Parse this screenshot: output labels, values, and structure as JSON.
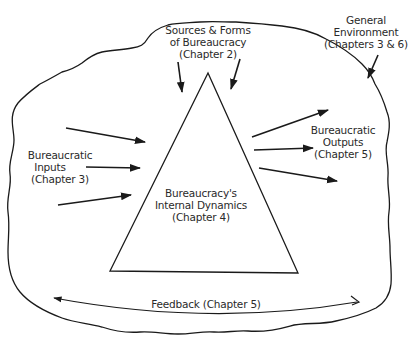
{
  "diagram": {
    "type": "conceptual-model",
    "colors": {
      "ink": "#1a1a1a",
      "text": "#2a2a2a",
      "background": "#ffffff"
    },
    "labels": {
      "sources": {
        "lines": [
          "Sources & Forms",
          "of Bureaucracy",
          "(Chapter 2)"
        ]
      },
      "environment": {
        "lines": [
          "General",
          "Environment",
          "(Chapters 3 & 6)"
        ]
      },
      "inputs": {
        "lines": [
          "Bureaucratic",
          "Inputs",
          "(Chapter 3)"
        ]
      },
      "internal": {
        "lines": [
          "Bureaucracy's",
          "Internal Dynamics",
          "(Chapter 4)"
        ]
      },
      "outputs": {
        "lines": [
          "Bureaucratic",
          "Outputs",
          "(Chapter 5)"
        ]
      },
      "feedback": {
        "text": "Feedback (Chapter 5)"
      }
    },
    "nodes": [
      {
        "id": "environment",
        "shape": "irregular-blob",
        "label": "General Environment (Chapters 3 & 6)"
      },
      {
        "id": "bureaucracy",
        "shape": "triangle",
        "label": "Bureaucracy's Internal Dynamics (Chapter 4)"
      }
    ],
    "edges": [
      {
        "from": "Sources & Forms of Bureaucracy",
        "to": "bureaucracy",
        "count": 2
      },
      {
        "from": "Bureaucratic Inputs",
        "to": "bureaucracy",
        "count": 3
      },
      {
        "from": "bureaucracy",
        "to": "Bureaucratic Outputs",
        "count": 3
      },
      {
        "from": "General Environment label",
        "to": "environment",
        "count": 1
      },
      {
        "from": "outputs side",
        "to": "inputs side",
        "label": "Feedback (Chapter 5)"
      }
    ]
  }
}
